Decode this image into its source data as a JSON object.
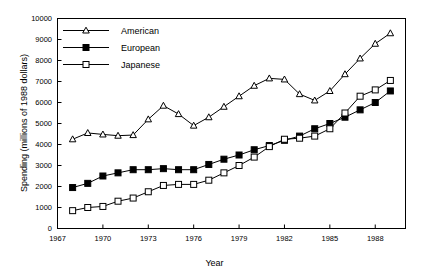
{
  "chart_data": {
    "type": "line",
    "title": "",
    "xlabel": "Year",
    "ylabel": "Spending (millions of 1988 dollars)",
    "xlim": [
      1967,
      1990
    ],
    "ylim": [
      0,
      10000
    ],
    "xticks": [
      1967,
      1970,
      1973,
      1976,
      1979,
      1982,
      1985,
      1988
    ],
    "yticks": [
      0,
      1000,
      2000,
      3000,
      4000,
      5000,
      6000,
      7000,
      8000,
      9000,
      10000
    ],
    "grid": false,
    "legend_position": "upper-left-inside",
    "x": [
      1968,
      1969,
      1970,
      1971,
      1972,
      1973,
      1974,
      1975,
      1976,
      1977,
      1978,
      1979,
      1980,
      1981,
      1982,
      1983,
      1984,
      1985,
      1986,
      1987,
      1988,
      1989
    ],
    "series": [
      {
        "name": "American",
        "marker": "open-triangle",
        "values": [
          4250,
          4550,
          4480,
          4420,
          4450,
          5200,
          5850,
          5450,
          4900,
          5300,
          5800,
          6300,
          6800,
          7150,
          7100,
          6400,
          6100,
          6550,
          7350,
          8100,
          8800,
          9300
        ]
      },
      {
        "name": "European",
        "marker": "filled-square",
        "values": [
          1950,
          2150,
          2500,
          2650,
          2800,
          2800,
          2850,
          2800,
          2800,
          3050,
          3300,
          3500,
          3750,
          3950,
          4200,
          4400,
          4750,
          5000,
          5300,
          5650,
          6000,
          6550
        ]
      },
      {
        "name": "Japanese",
        "marker": "open-square",
        "values": [
          850,
          1000,
          1050,
          1300,
          1450,
          1750,
          2050,
          2100,
          2100,
          2300,
          2650,
          3000,
          3400,
          3900,
          4250,
          4300,
          4400,
          4750,
          5500,
          6300,
          6600,
          7050
        ]
      }
    ]
  },
  "legend": {
    "items": [
      {
        "label": "American"
      },
      {
        "label": "European"
      },
      {
        "label": "Japanese"
      }
    ]
  },
  "colors": {
    "axis": "#000000",
    "series": "#000000",
    "background": "#ffffff"
  }
}
